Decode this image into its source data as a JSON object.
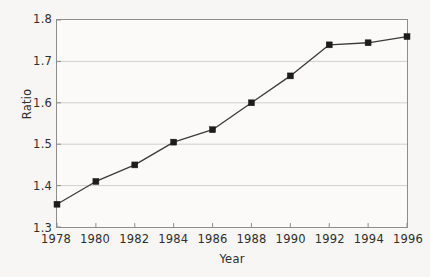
{
  "chart_data": {
    "type": "line",
    "title": "",
    "subtitle": "",
    "xlabel": "Year",
    "ylabel": "Ratio",
    "x": [
      1978,
      1980,
      1982,
      1984,
      1986,
      1988,
      1990,
      1992,
      1994,
      1996
    ],
    "values": [
      1.355,
      1.41,
      1.45,
      1.505,
      1.535,
      1.6,
      1.665,
      1.74,
      1.745,
      1.76
    ],
    "series": [
      {
        "name": "Ratio",
        "values": [
          1.355,
          1.41,
          1.45,
          1.505,
          1.535,
          1.6,
          1.665,
          1.74,
          1.745,
          1.76
        ]
      }
    ],
    "xlim": [
      1978,
      1996
    ],
    "ylim": [
      1.3,
      1.8
    ],
    "xticks": [
      1978,
      1980,
      1982,
      1984,
      1986,
      1988,
      1990,
      1992,
      1994,
      1996
    ],
    "xtick_labels": [
      "1978",
      "1980",
      "1982",
      "1984",
      "1986",
      "1988",
      "1990",
      "1992",
      "1994",
      "1996"
    ],
    "yticks": [
      1.3,
      1.4,
      1.5,
      1.6,
      1.7,
      1.8
    ],
    "ytick_labels": [
      "1.3",
      "1.4",
      "1.5",
      "1.6",
      "1.7",
      "1.8"
    ],
    "gridlines": [
      1.4,
      1.5,
      1.6,
      1.7
    ],
    "grid": "horizontal",
    "legend": "none",
    "marker": "square",
    "colors": {
      "background": "#f7f6f4",
      "plot_background": "#fbfaf9",
      "line": "#3a3a3a",
      "marker": "#1c1c1c",
      "grid": "#cfcfcf",
      "axis": "#8d8d8d",
      "text": "#2e2e2e"
    }
  }
}
